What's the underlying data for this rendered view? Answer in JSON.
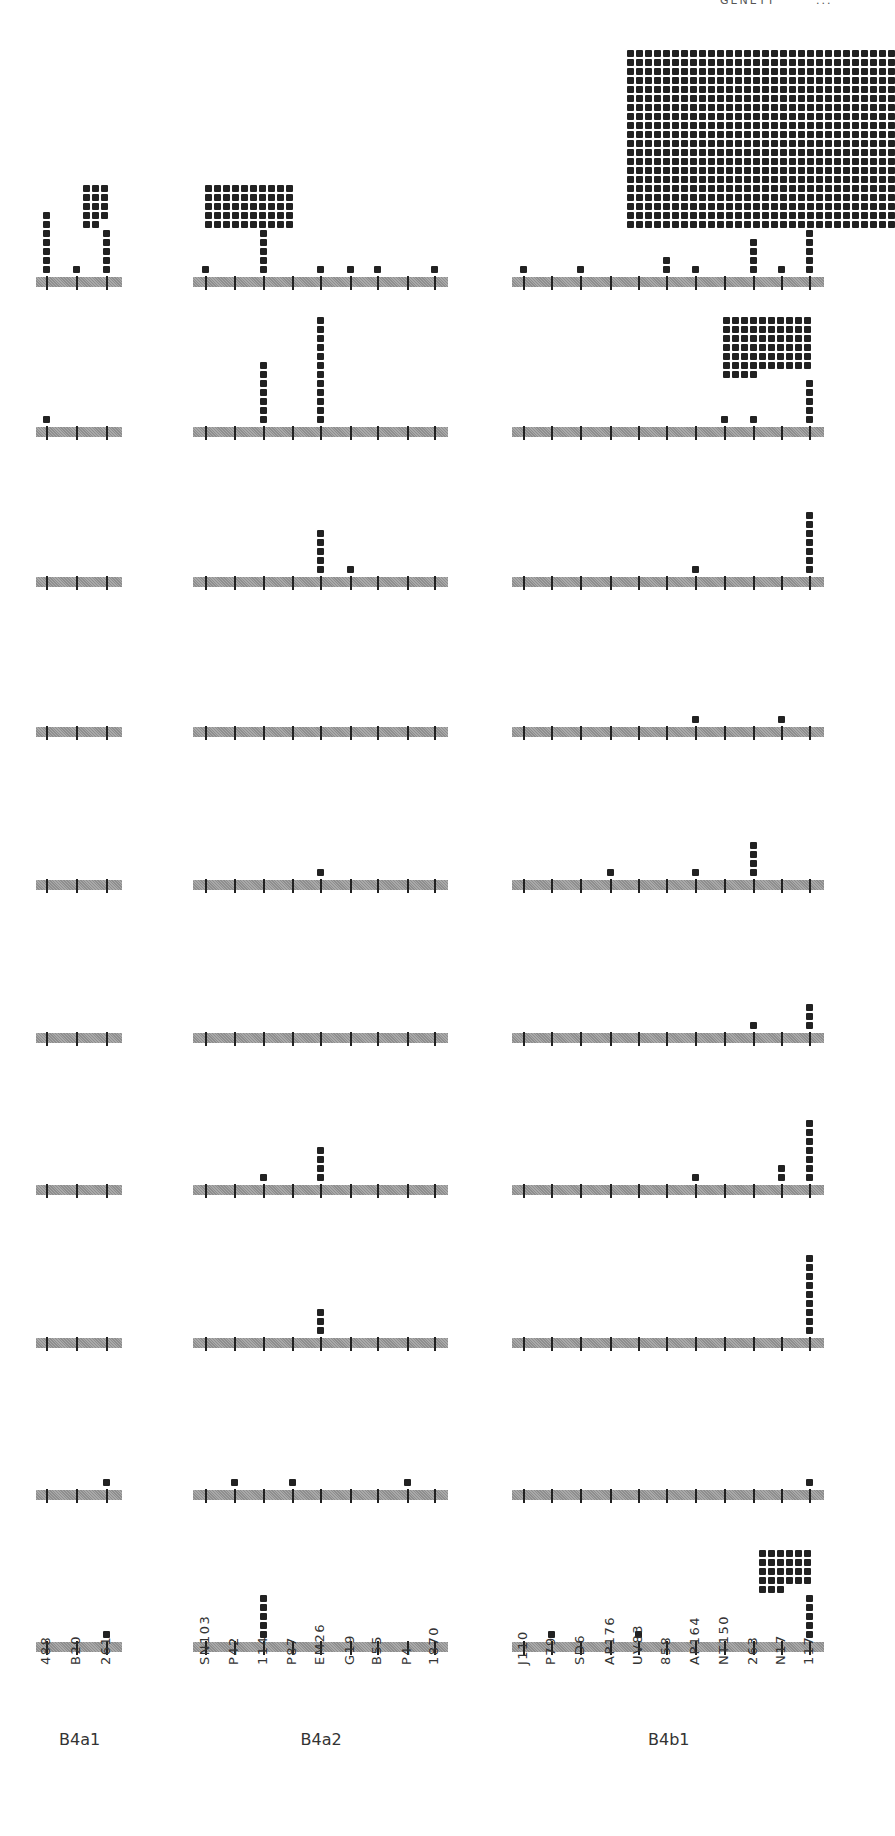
{
  "header": {
    "text": "GENETT",
    "page": "..."
  },
  "groups": [
    {
      "name": "B4a1",
      "x0": 36,
      "x1": 122,
      "ticks": [
        46,
        76,
        106
      ],
      "labels": [
        "488",
        "B20",
        "261"
      ]
    },
    {
      "name": "B4a2",
      "x0": 193,
      "x1": 448,
      "ticks": [
        205,
        234,
        263,
        292,
        320,
        350,
        377,
        407,
        434
      ],
      "labels": [
        "SN103",
        "P42",
        "114",
        "P87",
        "EM26",
        "G19",
        "B55",
        "P4",
        "1870"
      ]
    },
    {
      "name": "B4b1",
      "x0": 512,
      "x1": 824,
      "ticks": [
        523,
        551,
        580,
        610,
        638,
        666,
        695,
        724,
        753,
        781,
        809
      ],
      "labels": [
        "J110",
        "P79",
        "SD6",
        "AP176",
        "UV83",
        "858",
        "AP164",
        "NT150",
        "263",
        "N17",
        "117"
      ]
    }
  ],
  "chart_data": {
    "type": "table",
    "xlabel": "Sample identifiers grouped by haplogroup",
    "ylabel": "Count (each square = 1)",
    "groups": {
      "B4a1": [
        "488",
        "B20",
        "261"
      ],
      "B4a2": [
        "SN103",
        "P42",
        "114",
        "P87",
        "EM26",
        "G19",
        "B55",
        "P4",
        "1870"
      ],
      "B4b1": [
        "J110",
        "P79",
        "SD6",
        "AP176",
        "UV83",
        "858",
        "AP164",
        "NT150",
        "263",
        "N17",
        "117"
      ]
    },
    "panels": [
      {
        "row": 1,
        "B4a1": {
          "488": 7,
          "B20": 1,
          "261": 19
        },
        "B4a2": {
          "SN103": 1,
          "114": 55,
          "EM26": 1,
          "G19": 1,
          "B55": 1,
          "1870": 1
        },
        "B4b1": {
          "J110": 1,
          "SD6": 1,
          "858": 2,
          "AP164": 1,
          "263": 4,
          "N17": 1,
          "117": ">500 (grid cropped)"
        }
      },
      {
        "row": 2,
        "B4a1": {
          "488": 1
        },
        "B4a2": {
          "114": 7,
          "EM26": 12
        },
        "B4b1": {
          "NT150": 1,
          "263": 1,
          "117": 69
        }
      },
      {
        "row": 3,
        "B4a1": {},
        "B4a2": {
          "EM26": 5,
          "G19": 1
        },
        "B4b1": {
          "AP164": 1,
          "117": 7
        }
      },
      {
        "row": 4,
        "B4a1": {},
        "B4a2": {},
        "B4b1": {
          "AP164": 1,
          "N17": 1
        }
      },
      {
        "row": 5,
        "B4a1": {},
        "B4a2": {
          "EM26": 1
        },
        "B4b1": {
          "AP176": 1,
          "AP164": 1,
          "263": 4
        }
      },
      {
        "row": 6,
        "B4a1": {},
        "B4a2": {},
        "B4b1": {
          "263": 1,
          "117": 3
        }
      },
      {
        "row": 7,
        "B4a1": {},
        "B4a2": {
          "114": 1,
          "EM26": 4
        },
        "B4b1": {
          "AP164": 1,
          "N17": 2,
          "117": 7
        }
      },
      {
        "row": 8,
        "B4a1": {},
        "B4a2": {
          "EM26": 3
        },
        "B4b1": {
          "117": 9
        }
      },
      {
        "row": 9,
        "B4a1": {
          "261": 1
        },
        "B4a2": {
          "P42": 1,
          "P87": 1,
          "P4": 1
        },
        "B4b1": {
          "117": 1
        }
      },
      {
        "row": 10,
        "B4a1": {
          "261": 1
        },
        "B4a2": {
          "114": 5
        },
        "B4b1": {
          "P79": 1,
          "UV83": 1,
          "117": 32
        }
      }
    ]
  },
  "rows_axis_y": [
    277,
    427,
    577,
    727,
    880,
    1033,
    1185,
    1338,
    1490,
    1642
  ]
}
